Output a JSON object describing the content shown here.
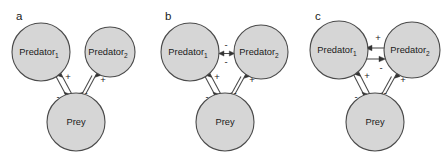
{
  "figure": {
    "background": "#ffffff",
    "node_fill": "#d6d6d6",
    "node_stroke": "#4a4a4a",
    "text_color": "#1a1a1a"
  },
  "labels": {
    "predator": "Predator",
    "sub1": "1",
    "sub2": "2",
    "prey": "Prey",
    "plus": "+",
    "minus": "-"
  },
  "panels": [
    {
      "letter": "a",
      "nodes": [
        {
          "id": "predator1",
          "name": "Predator",
          "subscript": "1",
          "cx": 41,
          "cy": 52,
          "r": 29
        },
        {
          "id": "predator2",
          "name": "Predator",
          "subscript": "2",
          "cx": 110,
          "cy": 52,
          "r": 25
        },
        {
          "id": "prey",
          "name": "Prey",
          "subscript": "",
          "cx": 76,
          "cy": 122,
          "r": 29
        }
      ],
      "edges": [
        {
          "from": "predator1",
          "to": "prey",
          "type": "double-line-bidirectional",
          "sign_near_predator": "+",
          "sign_near_prey": "-"
        },
        {
          "from": "predator2",
          "to": "prey",
          "type": "double-line-bidirectional",
          "sign_near_predator": "+",
          "sign_near_prey": "-"
        }
      ],
      "interspecific_link": "none"
    },
    {
      "letter": "b",
      "nodes": [
        {
          "id": "predator1",
          "name": "Predator",
          "subscript": "1",
          "cx": 41,
          "cy": 52,
          "r": 29
        },
        {
          "id": "predator2",
          "name": "Predator",
          "subscript": "2",
          "cx": 112,
          "cy": 52,
          "r": 27
        },
        {
          "id": "prey",
          "name": "Prey",
          "subscript": "",
          "cx": 76,
          "cy": 122,
          "r": 29
        }
      ],
      "edges": [
        {
          "from": "predator1",
          "to": "prey",
          "type": "double-line-bidirectional",
          "sign_near_predator": "+",
          "sign_near_prey": "-"
        },
        {
          "from": "predator2",
          "to": "prey",
          "type": "double-line-bidirectional",
          "sign_near_predator": "+",
          "sign_near_prey": "-"
        },
        {
          "from": "predator1",
          "to": "predator2",
          "type": "double-headed-arrow",
          "sign_above": "-",
          "sign_below": "-"
        }
      ],
      "interspecific_link": "competition-double-headed-arrow"
    },
    {
      "letter": "c",
      "nodes": [
        {
          "id": "predator1",
          "name": "Predator",
          "subscript": "1",
          "cx": 40,
          "cy": 50,
          "r": 29
        },
        {
          "id": "predator2",
          "name": "Predator",
          "subscript": "2",
          "cx": 113,
          "cy": 50,
          "r": 28
        },
        {
          "id": "prey",
          "name": "Prey",
          "subscript": "",
          "cx": 76,
          "cy": 122,
          "r": 29
        }
      ],
      "edges": [
        {
          "from": "predator1",
          "to": "prey",
          "type": "double-line-bidirectional",
          "sign_near_predator": "+",
          "sign_near_prey": "-"
        },
        {
          "from": "predator2",
          "to": "prey",
          "type": "double-line-bidirectional",
          "sign_near_predator": "+",
          "sign_near_prey": "-"
        },
        {
          "from": "predator2",
          "to": "predator1",
          "type": "arrow-left",
          "sign": "+"
        },
        {
          "from": "predator1",
          "to": "predator2",
          "type": "arrow-right",
          "sign": "-"
        }
      ],
      "interspecific_link": "intraguild-predation-two-arrows"
    }
  ]
}
